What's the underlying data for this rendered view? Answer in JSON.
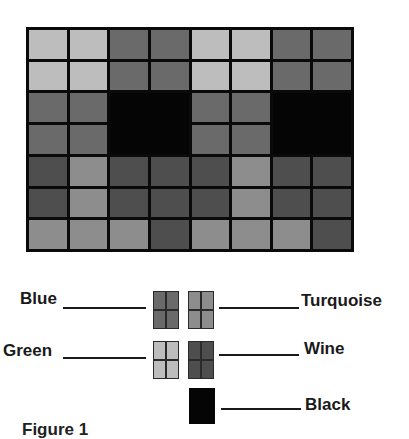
{
  "figure": {
    "caption": "Figure 1",
    "colors": {
      "Blue": "#6a6a6a",
      "Turquoise": "#8d8d8d",
      "Green": "#bdbdbd",
      "Wine": "#4e4e4e",
      "Black": "#050505",
      "grid_line": "#0a0a0a"
    },
    "grid": {
      "columns": 8,
      "rows": 7,
      "cells": [
        [
          "Green",
          "Green",
          "Blue",
          "Blue",
          "Green",
          "Green",
          "Blue",
          "Blue"
        ],
        [
          "Green",
          "Green",
          "Blue",
          "Blue",
          "Green",
          "Green",
          "Blue",
          "Blue"
        ],
        [
          "Blue",
          "Blue",
          "Black",
          "Black",
          "Blue",
          "Blue",
          "Black",
          "Black"
        ],
        [
          "Blue",
          "Blue",
          "Black",
          "Black",
          "Blue",
          "Blue",
          "Black",
          "Black"
        ],
        [
          "Wine",
          "Turquoise",
          "Wine",
          "Wine",
          "Wine",
          "Turquoise",
          "Wine",
          "Wine"
        ],
        [
          "Wine",
          "Turquoise",
          "Wine",
          "Wine",
          "Wine",
          "Turquoise",
          "Wine",
          "Wine"
        ],
        [
          "Turquoise",
          "Turquoise",
          "Turquoise",
          "Wine",
          "Turquoise",
          "Turquoise",
          "Turquoise",
          "Wine"
        ]
      ]
    },
    "legend": [
      {
        "label": "Blue",
        "color_key": "Blue",
        "side": "left"
      },
      {
        "label": "Turquoise",
        "color_key": "Turquoise",
        "side": "right"
      },
      {
        "label": "Green",
        "color_key": "Green",
        "side": "left"
      },
      {
        "label": "Wine",
        "color_key": "Wine",
        "side": "right"
      },
      {
        "label": "Black",
        "color_key": "Black",
        "side": "right"
      }
    ]
  }
}
